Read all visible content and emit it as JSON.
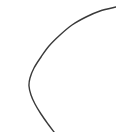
{
  "figure": {
    "label": "4.",
    "background_color": "#ffffff",
    "width": 116,
    "height": 132,
    "stroke_color": "#3a3a3a",
    "stroke_width": 1.4
  },
  "chart_data": {
    "type": "line",
    "title": "",
    "subtitle": "",
    "xlabel": "",
    "ylabel": "",
    "grid": false,
    "legend": null,
    "axis_visible": false,
    "xlim": [
      0,
      116
    ],
    "ylim": [
      0,
      132
    ],
    "annotations": [
      {
        "name": "figure-number",
        "text": "4.",
        "x": 3,
        "y": 7
      }
    ],
    "series": [
      {
        "name": "circular-arc",
        "description": "open circular arc, left portion of a circle",
        "shape": "arc",
        "center_x": 93,
        "center_y": 72,
        "radius": 65,
        "start_angle_deg": 175,
        "end_angle_deg": 255,
        "sweep": "counterclockwise",
        "closed": false,
        "stroke": "#3a3a3a",
        "stroke_width": 1.4,
        "fill": "none",
        "points": [
          {
            "x": 116,
            "y": 7
          },
          {
            "x": 100,
            "y": 11
          },
          {
            "x": 86,
            "y": 17
          },
          {
            "x": 72,
            "y": 25
          },
          {
            "x": 60,
            "y": 35
          },
          {
            "x": 49,
            "y": 46
          },
          {
            "x": 41,
            "y": 57
          },
          {
            "x": 34,
            "y": 68
          },
          {
            "x": 30,
            "y": 78
          },
          {
            "x": 29,
            "y": 86
          },
          {
            "x": 31,
            "y": 95
          },
          {
            "x": 35,
            "y": 104
          },
          {
            "x": 41,
            "y": 114
          },
          {
            "x": 48,
            "y": 124
          },
          {
            "x": 54,
            "y": 132
          }
        ]
      }
    ]
  }
}
